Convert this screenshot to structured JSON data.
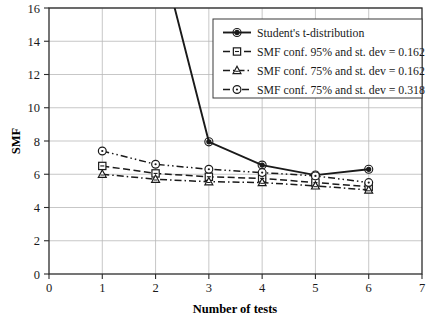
{
  "chart_data": {
    "type": "line",
    "title": "",
    "xlabel": "Number of tests",
    "ylabel": "SMF",
    "xlim": [
      0,
      7
    ],
    "ylim": [
      0,
      16
    ],
    "xticks": [
      "0",
      "1",
      "2",
      "3",
      "4",
      "5",
      "6",
      "7"
    ],
    "yticks": [
      "0",
      "2",
      "4",
      "6",
      "8",
      "10",
      "12",
      "14",
      "16"
    ],
    "grid": true,
    "legend_position": "top-right",
    "x": [
      1,
      2,
      3,
      4,
      5,
      6
    ],
    "series": [
      {
        "name": "Student's t-distribution",
        "marker": "circle-filled",
        "linestyle": "solid",
        "color": "#1a1a1a",
        "values": [
          63.0,
          20.5,
          7.95,
          6.55,
          5.95,
          6.3
        ],
        "clipped_above_ylim": [
          1,
          2
        ]
      },
      {
        "name": "SMF conf. 95% and st. dev = 0.162",
        "marker": "square",
        "linestyle": "dashed",
        "color": "#1a1a1a",
        "values": [
          6.5,
          6.05,
          5.85,
          5.75,
          5.5,
          5.25
        ]
      },
      {
        "name": "SMF conf. 75% and st. dev = 0.162",
        "marker": "triangle",
        "linestyle": "dash-dot",
        "color": "#1a1a1a",
        "values": [
          6.0,
          5.7,
          5.55,
          5.5,
          5.3,
          5.05
        ]
      },
      {
        "name": "SMF conf. 75% and st. dev = 0.318",
        "marker": "circle-open",
        "linestyle": "dash-dot-dot",
        "color": "#1a1a1a",
        "values": [
          7.4,
          6.6,
          6.3,
          6.1,
          5.9,
          5.5
        ]
      }
    ]
  },
  "axes": {
    "ylabel": "SMF",
    "xlabel": "Number of tests",
    "yticks": [
      "16",
      "14",
      "12",
      "10",
      "8",
      "6",
      "4",
      "2",
      "0"
    ],
    "xticks": [
      "0",
      "1",
      "2",
      "3",
      "4",
      "5",
      "6",
      "7"
    ]
  },
  "legend": {
    "items": [
      {
        "label": "Student's t-distribution",
        "marker": "circle-filled-icon",
        "line": "solid"
      },
      {
        "label": "SMF conf. 95% and st. dev = 0.162",
        "marker": "square-icon",
        "line": "dashed"
      },
      {
        "label": "SMF conf. 75% and st. dev = 0.162",
        "marker": "triangle-icon",
        "line": "dash-dot"
      },
      {
        "label": "SMF conf. 75% and st. dev = 0.318",
        "marker": "circle-open-icon",
        "line": "dash-dot-dot"
      }
    ]
  },
  "colors": {
    "line": "#1a1a1a",
    "grid": "#b9b9b9",
    "frame": "#2b2b2b",
    "background": "#ffffff"
  }
}
